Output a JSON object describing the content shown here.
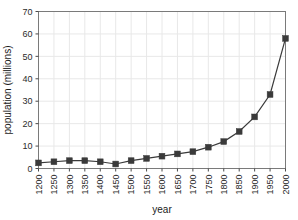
{
  "chart_data": {
    "type": "line",
    "title": "",
    "xlabel": "year",
    "ylabel": "population (millions)",
    "xlim": [
      1200,
      2000
    ],
    "ylim": [
      0,
      70
    ],
    "xticks": [
      1200,
      1250,
      1300,
      1350,
      1400,
      1450,
      1500,
      1550,
      1600,
      1650,
      1700,
      1750,
      1800,
      1850,
      1900,
      1950,
      2000
    ],
    "yticks": [
      0,
      10,
      20,
      30,
      40,
      50,
      60,
      70
    ],
    "xtick_labels": [
      "1200",
      "1250",
      "1300",
      "1350",
      "1400",
      "1450",
      "1500",
      "1550",
      "1600",
      "1650",
      "1700",
      "1750",
      "1800",
      "1850",
      "1900",
      "1950",
      "2000"
    ],
    "ytick_labels": [
      "0",
      "10",
      "20",
      "30",
      "40",
      "50",
      "60",
      "70"
    ],
    "grid": true,
    "legend": false,
    "marker": "square",
    "series": [
      {
        "name": "population",
        "x": [
          1200,
          1250,
          1300,
          1350,
          1400,
          1450,
          1500,
          1550,
          1600,
          1650,
          1700,
          1750,
          1800,
          1850,
          1900,
          1950,
          2000
        ],
        "values": [
          2.5,
          3.0,
          3.5,
          3.5,
          3.0,
          2.0,
          3.5,
          4.5,
          5.5,
          6.5,
          7.5,
          9.5,
          12.0,
          16.5,
          23.0,
          33.0,
          58.0
        ]
      }
    ],
    "colors": {
      "line": "#3a3a3a",
      "marker": "#3a3a3a",
      "grid": "#e8e8e8",
      "axis": "#7a7a7a",
      "text": "#2b2b2b",
      "background": "#ffffff"
    }
  }
}
